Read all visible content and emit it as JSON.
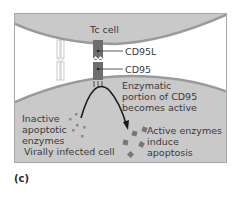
{
  "diagram": {
    "labels": {
      "tc_cell": "Tc cell",
      "cd95l": "CD95L",
      "cd95": "CD95",
      "enzymatic": "Enzymatic\nportion of CD95\nbecomes active",
      "inactive": "Inactive\napoptotic\nenzymes",
      "active": "Active enzymes\ninduce apoptosis",
      "infected_cell": "Virally infected cell"
    },
    "panel_label": "(c)",
    "colors": {
      "cell_fill": "#c9c9c9",
      "membrane": "#9a9a9a",
      "receptor": "#6e6e6e",
      "enzyme": "#7a7a7a",
      "arrow": "#1a1a1a",
      "frame": "#a8a8a8"
    }
  }
}
